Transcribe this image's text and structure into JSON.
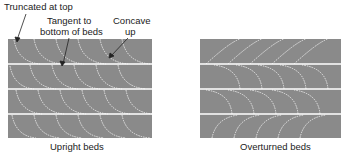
{
  "annotations": {
    "truncated": "Truncated at top",
    "tangent_line1": "Tangent to",
    "tangent_line2": "bottom of beds",
    "concave_line1": "Concave",
    "concave_line2": "up"
  },
  "panels": {
    "left_caption": "Upright beds",
    "right_caption": "Overturned beds"
  },
  "colors": {
    "bed_fill": "#8a8a8a",
    "bed_boundary": "#ffffff",
    "lamina": "#e8e8e8"
  }
}
